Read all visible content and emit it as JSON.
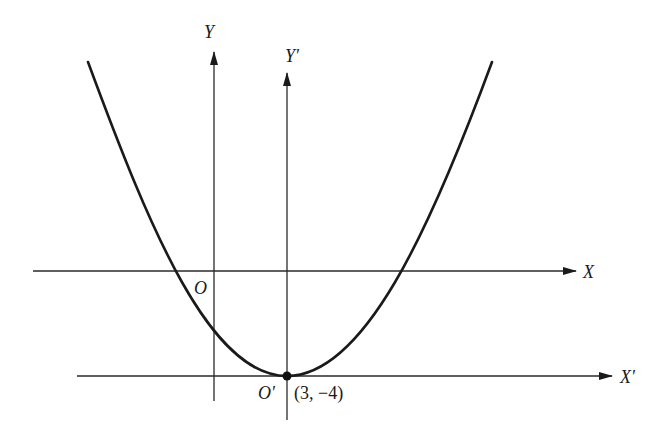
{
  "diagram": {
    "curve": {
      "type": "parabola",
      "vertex_label": "O′",
      "vertex_coords": "(3, −4)"
    },
    "axes": {
      "x": {
        "label": "X"
      },
      "y": {
        "label": "Y"
      },
      "x_prime": {
        "label": "X′"
      },
      "y_prime": {
        "label": "Y′"
      },
      "origin": {
        "label": "O"
      }
    },
    "colors": {
      "stroke": "#1a1a1a",
      "axis": "#2a2a2a",
      "background": "#ffffff"
    }
  }
}
